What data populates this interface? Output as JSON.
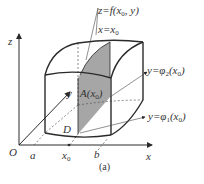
{
  "figure": {
    "caption": "(a)",
    "axes": {
      "x_label": "x",
      "z_label": "z",
      "y_label": "y",
      "origin_label": "O"
    },
    "x_ticks": {
      "a": "a",
      "x0": "x",
      "x0_sub": "0",
      "b": "b"
    },
    "region_label": "D",
    "section_label": {
      "main": "A(x",
      "sub": "0",
      "close": ")"
    },
    "annotations": {
      "surface": {
        "pre": "z=f(x",
        "sub": "0",
        "post": ", y)"
      },
      "plane": {
        "pre": "x=x",
        "sub": "0"
      },
      "phi2": {
        "pre": "y=φ",
        "fsub": "2",
        "mid": "(x",
        "sub": "0",
        "post": ")"
      },
      "phi1": {
        "pre": "y=φ",
        "fsub": "1",
        "mid": "(x",
        "sub": "0",
        "post": ")"
      }
    },
    "colors": {
      "line": "#2a2a2a",
      "shade": "#a6a6a6",
      "thin": "#555555"
    }
  }
}
